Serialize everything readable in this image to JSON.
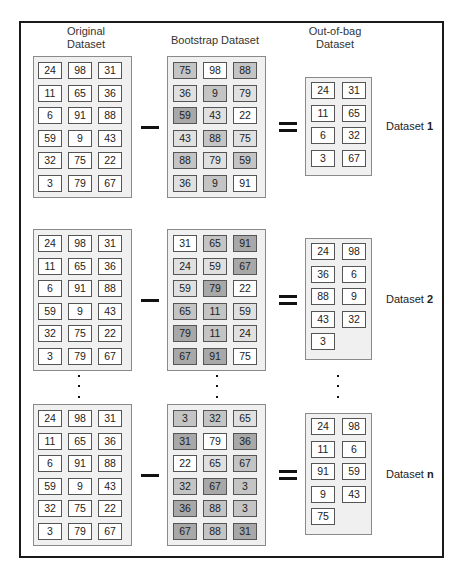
{
  "headers": {
    "original": "Original\nDataset",
    "bootstrap": "Bootstrap Dataset",
    "oob": "Out-of-bag\nDataset"
  },
  "colors": {
    "shade0": "#ffffff",
    "shade1": "#e0e0e0",
    "shade2": "#c4c4c4",
    "shade3": "#a8a8a8"
  },
  "rows": [
    {
      "label_prefix": "Dataset ",
      "label_suffix": "1",
      "original": [
        [
          24,
          98,
          31
        ],
        [
          11,
          65,
          36
        ],
        [
          6,
          91,
          88
        ],
        [
          59,
          9,
          43
        ],
        [
          32,
          75,
          22
        ],
        [
          3,
          79,
          67
        ]
      ],
      "bootstrap": [
        [
          75,
          98,
          88
        ],
        [
          36,
          9,
          79
        ],
        [
          59,
          43,
          22
        ],
        [
          43,
          88,
          75
        ],
        [
          88,
          79,
          59
        ],
        [
          36,
          9,
          91
        ]
      ],
      "bootstrap_shade": [
        [
          2,
          0,
          2
        ],
        [
          1,
          2,
          1
        ],
        [
          3,
          1,
          0
        ],
        [
          1,
          2,
          1
        ],
        [
          2,
          1,
          2
        ],
        [
          1,
          2,
          0
        ]
      ],
      "oob": [
        [
          24,
          31
        ],
        [
          11,
          65
        ],
        [
          6,
          32
        ],
        [
          3,
          67
        ]
      ]
    },
    {
      "label_prefix": "Dataset ",
      "label_suffix": "2",
      "original": [
        [
          24,
          98,
          31
        ],
        [
          11,
          65,
          36
        ],
        [
          6,
          91,
          88
        ],
        [
          59,
          9,
          43
        ],
        [
          32,
          75,
          22
        ],
        [
          3,
          79,
          67
        ]
      ],
      "bootstrap": [
        [
          31,
          65,
          91
        ],
        [
          24,
          59,
          67
        ],
        [
          59,
          79,
          22
        ],
        [
          65,
          11,
          59
        ],
        [
          79,
          11,
          24
        ],
        [
          67,
          91,
          75
        ]
      ],
      "bootstrap_shade": [
        [
          0,
          2,
          3
        ],
        [
          1,
          1,
          3
        ],
        [
          1,
          3,
          0
        ],
        [
          2,
          2,
          1
        ],
        [
          3,
          2,
          1
        ],
        [
          3,
          3,
          0
        ]
      ],
      "oob": [
        [
          24,
          98
        ],
        [
          36,
          6
        ],
        [
          88,
          9
        ],
        [
          43,
          32
        ],
        [
          3
        ]
      ]
    },
    {
      "label_prefix": "Dataset ",
      "label_suffix": "n",
      "original": [
        [
          24,
          98,
          31
        ],
        [
          11,
          65,
          36
        ],
        [
          6,
          91,
          88
        ],
        [
          59,
          9,
          43
        ],
        [
          32,
          75,
          22
        ],
        [
          3,
          79,
          67
        ]
      ],
      "bootstrap": [
        [
          3,
          32,
          65
        ],
        [
          31,
          79,
          36
        ],
        [
          22,
          65,
          67
        ],
        [
          32,
          67,
          3
        ],
        [
          36,
          88,
          3
        ],
        [
          67,
          88,
          31
        ]
      ],
      "bootstrap_shade": [
        [
          2,
          2,
          1
        ],
        [
          3,
          0,
          3
        ],
        [
          0,
          1,
          2
        ],
        [
          2,
          3,
          2
        ],
        [
          3,
          2,
          2
        ],
        [
          3,
          2,
          3
        ]
      ],
      "oob": [
        [
          24,
          98
        ],
        [
          11,
          6
        ],
        [
          91,
          59
        ],
        [
          9,
          43
        ],
        [
          75
        ]
      ]
    }
  ]
}
